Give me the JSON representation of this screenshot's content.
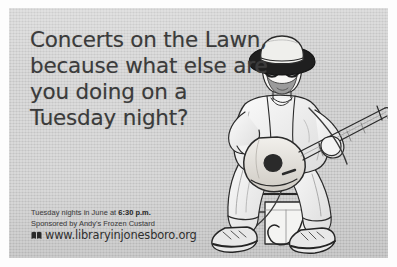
{
  "poster": {
    "background_color": "#c9c9c9",
    "border_color": "#ffffff",
    "text_color": "#3b3b3b"
  },
  "headline": {
    "line1": "Concerts on the Lawn,",
    "line2": "because what else are",
    "line3": "you doing on a",
    "line4": "Tuesday night?"
  },
  "details": {
    "schedule_prefix": "Tuesday nights in June at ",
    "schedule_time": "6:30 p.m.",
    "sponsor": "Sponsored by Andy's Frozen Custard",
    "url": "www.libraryinjonesboro.org",
    "url_icon": "open-book-icon"
  },
  "illustration": {
    "subject": "seated-guitarist",
    "description": "Bearded man in bucket hat and round glasses playing an acoustic guitar while seated on a stool",
    "ink_color": "#2b2b2b"
  }
}
